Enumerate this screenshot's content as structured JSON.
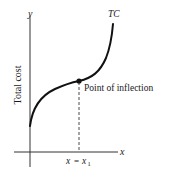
{
  "diagram": {
    "axes": {
      "y_label": "y",
      "x_label": "x",
      "y_axis_title": "Total cost"
    },
    "curve": {
      "label": "TC"
    },
    "annotation": {
      "inflection_label": "Point of inflection",
      "x_marker_lhs": "x",
      "x_marker_eq": "=",
      "x_marker_rhs": "x",
      "x_marker_sub": "1"
    },
    "colors": {
      "ink": "#1a1a1a",
      "background": "#ffffff"
    }
  }
}
